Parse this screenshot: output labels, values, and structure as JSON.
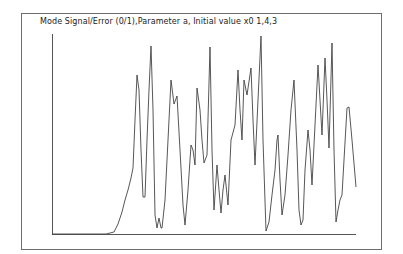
{
  "title": "Mode Signal/Error (0/1),Parameter a, Initial value x0 1,4,3",
  "colors": {
    "line": "#444444",
    "axis": "#555555",
    "frame": "#6e6e6e",
    "background": "#ffffff"
  },
  "chart_data": {
    "type": "line",
    "title": "Mode Signal/Error (0/1),Parameter a, Initial value x0 1,4,3",
    "xlabel": "",
    "ylabel": "",
    "grid": false,
    "legend": null,
    "axis_pixels": {
      "x0": 52,
      "x1": 356,
      "y_top": 34,
      "y_base": 234
    },
    "points_px": [
      [
        52,
        234
      ],
      [
        100,
        234
      ],
      [
        106,
        234
      ],
      [
        110,
        233
      ],
      [
        114,
        232
      ],
      [
        118,
        224
      ],
      [
        122,
        212
      ],
      [
        125,
        200
      ],
      [
        128,
        190
      ],
      [
        131,
        178
      ],
      [
        133,
        168
      ],
      [
        135,
        120
      ],
      [
        137,
        75
      ],
      [
        139,
        90
      ],
      [
        141,
        150
      ],
      [
        143,
        197
      ],
      [
        145,
        197
      ],
      [
        147,
        140
      ],
      [
        149,
        90
      ],
      [
        151,
        46
      ],
      [
        153,
        110
      ],
      [
        155,
        215
      ],
      [
        157,
        228
      ],
      [
        159,
        218
      ],
      [
        161,
        228
      ],
      [
        162,
        228
      ],
      [
        165,
        200
      ],
      [
        168,
        140
      ],
      [
        171,
        80
      ],
      [
        174,
        104
      ],
      [
        177,
        96
      ],
      [
        180,
        150
      ],
      [
        183,
        205
      ],
      [
        185,
        225
      ],
      [
        188,
        190
      ],
      [
        191,
        145
      ],
      [
        193,
        150
      ],
      [
        195,
        165
      ],
      [
        197,
        88
      ],
      [
        200,
        110
      ],
      [
        202,
        140
      ],
      [
        204,
        163
      ],
      [
        207,
        155
      ],
      [
        210,
        47
      ],
      [
        212,
        150
      ],
      [
        214,
        210
      ],
      [
        217,
        165
      ],
      [
        219,
        190
      ],
      [
        221,
        213
      ],
      [
        223,
        190
      ],
      [
        225,
        175
      ],
      [
        228,
        205
      ],
      [
        231,
        140
      ],
      [
        235,
        125
      ],
      [
        238,
        70
      ],
      [
        240,
        110
      ],
      [
        242,
        140
      ],
      [
        244,
        80
      ],
      [
        247,
        95
      ],
      [
        251,
        68
      ],
      [
        253,
        120
      ],
      [
        255,
        165
      ],
      [
        258,
        100
      ],
      [
        261,
        36
      ],
      [
        263,
        140
      ],
      [
        266,
        231
      ],
      [
        269,
        222
      ],
      [
        272,
        195
      ],
      [
        275,
        170
      ],
      [
        277,
        140
      ],
      [
        278,
        135
      ],
      [
        280,
        180
      ],
      [
        282,
        215
      ],
      [
        285,
        195
      ],
      [
        288,
        155
      ],
      [
        291,
        110
      ],
      [
        294,
        80
      ],
      [
        297,
        150
      ],
      [
        299,
        210
      ],
      [
        301,
        225
      ],
      [
        303,
        220
      ],
      [
        305,
        170
      ],
      [
        308,
        130
      ],
      [
        310,
        150
      ],
      [
        312,
        185
      ],
      [
        315,
        125
      ],
      [
        318,
        65
      ],
      [
        320,
        100
      ],
      [
        322,
        135
      ],
      [
        325,
        58
      ],
      [
        327,
        100
      ],
      [
        329,
        148
      ],
      [
        332,
        43
      ],
      [
        334,
        150
      ],
      [
        336,
        222
      ],
      [
        338,
        210
      ],
      [
        340,
        200
      ],
      [
        342,
        195
      ],
      [
        344,
        160
      ],
      [
        347,
        108
      ],
      [
        349,
        107
      ],
      [
        352,
        140
      ],
      [
        356,
        187
      ]
    ]
  }
}
